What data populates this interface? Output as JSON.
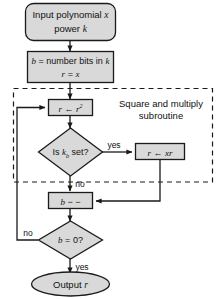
{
  "diagram": {
    "colors": {
      "node_fill": "#d9d9d9",
      "node_stroke": "#1a1a1a",
      "line": "#1a1a1a",
      "dashed_group": "#1a1a1a",
      "background": "#ffffff",
      "text": "#111111"
    },
    "nodes": {
      "start": {
        "shape": "rounded-rect",
        "line1_a": "Input polynomial",
        "line1_b": "x",
        "line2_a": "power",
        "line2_b": "k"
      },
      "init": {
        "shape": "rect",
        "line1_a": "b",
        "line1_b": "= number bits in",
        "line1_c": "k",
        "line2_a": "r",
        "line2_b": "=",
        "line2_c": "x"
      },
      "square": {
        "shape": "rect",
        "lhs": "r",
        "arrow": "←",
        "rhs": "r",
        "exponent": "2"
      },
      "bit_test": {
        "shape": "diamond",
        "prefix": "Is",
        "var": "k",
        "subscript": "b",
        "suffix": "set?"
      },
      "multiply": {
        "shape": "rect",
        "lhs": "r",
        "arrow": "←",
        "rhs_a": "x",
        "rhs_b": "r"
      },
      "decrement": {
        "shape": "rect",
        "var": "b",
        "op": "− −"
      },
      "loop_test": {
        "shape": "diamond",
        "lhs": "b",
        "op": "=",
        "rhs": "0?"
      },
      "output": {
        "shape": "ellipse",
        "label": "Output",
        "var": "r"
      }
    },
    "group_label": {
      "line1": "Square and multiply",
      "line2": "subroutine"
    },
    "edge_labels": {
      "bit_yes": "yes",
      "bit_no": "no",
      "loop_no": "no",
      "loop_yes": "yes"
    }
  }
}
